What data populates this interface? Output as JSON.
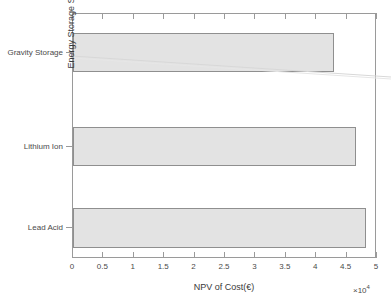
{
  "chart_data": {
    "type": "bar",
    "orientation": "horizontal",
    "title": "",
    "xlabel": "NPV of Cost(€)",
    "ylabel": "Energy Storage System",
    "categories": [
      "Gravity Storage",
      "Lithium Ion",
      "Lead Acid"
    ],
    "values": [
      43000,
      46500,
      48200
    ],
    "value_labels": [
      "4.3",
      "4.65",
      "4.82"
    ],
    "xlim": [
      0,
      50000
    ],
    "ylim_categories": [
      "Lead Acid",
      "Lithium Ion",
      "Gravity Storage"
    ],
    "x_exponent_base": "10",
    "x_exponent_power": "4",
    "x_exponent_prefix": "×",
    "xticks": [
      0,
      5000,
      10000,
      15000,
      20000,
      25000,
      30000,
      35000,
      40000,
      45000,
      50000
    ],
    "xtick_labels": [
      "0",
      "0.5",
      "1",
      "1.5",
      "2",
      "2.5",
      "3",
      "3.5",
      "4",
      "4.5",
      "5"
    ],
    "grid": false,
    "legend": null,
    "bar_fill_color": "#e3e3e3",
    "bar_edge_color": "#8f8f8f",
    "axes_color": "#9a9a9a",
    "text_color": "#3a3a3a",
    "background_color": "#ffffff"
  },
  "figure": {
    "artifact_name": "diagonal-scan-artifact"
  }
}
